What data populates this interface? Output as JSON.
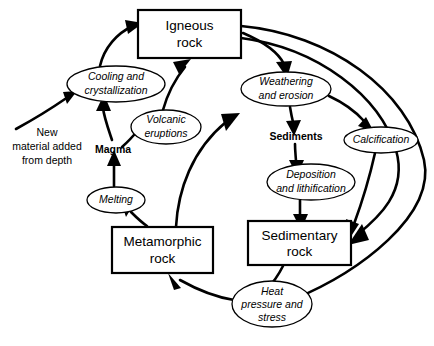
{
  "diagram": {
    "colors": {
      "background": "#ffffff",
      "stroke": "#000000",
      "text": "#000000"
    },
    "boxes": [
      {
        "id": "igneous-rock",
        "line1": "Igneous",
        "line2": "rock",
        "x": 138,
        "y": 10,
        "w": 103,
        "h": 48
      },
      {
        "id": "metamorphic-rock",
        "line1": "Metamorphic",
        "line2": "rock",
        "x": 112,
        "y": 227,
        "w": 101,
        "h": 46
      },
      {
        "id": "sedimentary-rock",
        "line1": "Sedimentary",
        "line2": "rock",
        "x": 248,
        "y": 221,
        "w": 103,
        "h": 44
      }
    ],
    "ellipses": [
      {
        "id": "cooling-and-crystallization",
        "line1": "Cooling and",
        "line2": "crystallization",
        "cx": 116,
        "cy": 84,
        "rx": 49,
        "ry": 18
      },
      {
        "id": "volcanic-eruptions",
        "line1": "Volcanic",
        "line2": "eruptions",
        "cx": 166,
        "cy": 127,
        "rx": 35,
        "ry": 17
      },
      {
        "id": "weathering-and-erosion",
        "line1": "Weathering",
        "line2": "and erosion",
        "cx": 286,
        "cy": 89,
        "rx": 45,
        "ry": 17
      },
      {
        "id": "calcification",
        "line1": "Calcification",
        "line2": "",
        "cx": 381,
        "cy": 140,
        "rx": 37,
        "ry": 13
      },
      {
        "id": "deposition-and-lithification",
        "line1": "Deposition",
        "line2": "and lithification",
        "cx": 311,
        "cy": 182,
        "rx": 44,
        "ry": 18
      },
      {
        "id": "melting",
        "line1": "Melting",
        "line2": "",
        "cx": 116,
        "cy": 200,
        "rx": 29,
        "ry": 13
      },
      {
        "id": "heat-pressure-and-stress",
        "line1": "Heat",
        "line2": "pressure and",
        "line3": "stress",
        "cx": 272,
        "cy": 304,
        "rx": 40,
        "ry": 23
      }
    ],
    "labels": [
      {
        "id": "new-material-added-from-depth",
        "line1": "New",
        "line2": "material added",
        "line3": "from depth",
        "cx": 47,
        "cy": 146,
        "bold": false
      },
      {
        "id": "magma",
        "line1": "Magma",
        "cx": 113,
        "cy": 150,
        "bold": true
      },
      {
        "id": "sediments",
        "line1": "Sediments",
        "cx": 296,
        "cy": 137,
        "bold": true
      }
    ],
    "arrows": [
      {
        "id": "cooling-to-igneous",
        "from": "cooling-and-crystallization",
        "to": "igneous-rock"
      },
      {
        "id": "volcanic-to-igneous",
        "from": "volcanic-eruptions",
        "to": "igneous-rock"
      },
      {
        "id": "magma-to-cooling",
        "from": "magma",
        "to": "cooling-and-crystallization"
      },
      {
        "id": "magma-to-volcanic",
        "from": "magma",
        "to": "volcanic-eruptions"
      },
      {
        "id": "new-material-to-cooling",
        "from": "new-material-added-from-depth",
        "to": "cooling-and-crystallization"
      },
      {
        "id": "melting-to-magma",
        "from": "melting",
        "to": "magma"
      },
      {
        "id": "metamorphic-to-melting",
        "from": "metamorphic-rock",
        "to": "melting"
      },
      {
        "id": "metamorphic-to-weathering",
        "from": "metamorphic-rock",
        "to": "weathering-and-erosion"
      },
      {
        "id": "igneous-to-weathering",
        "from": "igneous-rock",
        "to": "weathering-and-erosion"
      },
      {
        "id": "weathering-to-sediments",
        "from": "weathering-and-erosion",
        "to": "sediments"
      },
      {
        "id": "weathering-to-calcification",
        "from": "weathering-and-erosion",
        "to": "calcification"
      },
      {
        "id": "sediments-to-deposition",
        "from": "sediments",
        "to": "deposition-and-lithification"
      },
      {
        "id": "deposition-to-sedimentary",
        "from": "deposition-and-lithification",
        "to": "sedimentary-rock"
      },
      {
        "id": "calcification-to-sedimentary",
        "from": "calcification",
        "to": "sedimentary-rock"
      },
      {
        "id": "igneous-to-sedimentary-outer",
        "from": "igneous-rock",
        "to": "sedimentary-rock"
      },
      {
        "id": "igneous-to-heat-outer",
        "from": "igneous-rock",
        "to": "heat-pressure-and-stress"
      },
      {
        "id": "sedimentary-to-heat",
        "from": "sedimentary-rock",
        "to": "heat-pressure-and-stress"
      },
      {
        "id": "heat-to-metamorphic",
        "from": "heat-pressure-and-stress",
        "to": "metamorphic-rock"
      }
    ]
  }
}
